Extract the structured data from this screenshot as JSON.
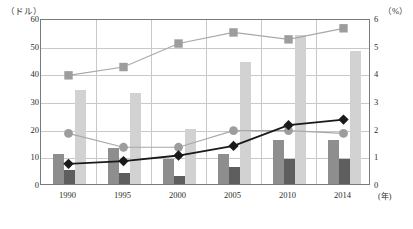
{
  "axes": {
    "left_unit": "（ドル）",
    "right_unit": "（%）",
    "x_unit": "(年)",
    "left_ticks": [
      "0",
      "10",
      "20",
      "30",
      "40",
      "50",
      "60"
    ],
    "right_ticks": [
      "0",
      "1",
      "2",
      "3",
      "4",
      "5",
      "6"
    ]
  },
  "chart_data": {
    "type": "bar",
    "title": "",
    "subtitle": "",
    "xlabel": "(年)",
    "ylabel": "（ドル）",
    "y2label": "（%）",
    "ylim": [
      0,
      60
    ],
    "y2lim": [
      0,
      6
    ],
    "grid": true,
    "legend": "none",
    "categories": [
      "1990",
      "1995",
      "2000",
      "2005",
      "2010",
      "2014"
    ],
    "series": [
      {
        "name": "bar-series-1",
        "type": "bar",
        "axis": "left",
        "color": "#8e8e8e",
        "values": [
          11,
          13,
          9,
          11,
          16,
          16
        ]
      },
      {
        "name": "bar-series-2",
        "type": "bar",
        "axis": "left",
        "color": "#5e5e5e",
        "values": [
          5,
          4,
          3,
          6,
          9,
          9
        ]
      },
      {
        "name": "bar-series-3",
        "type": "bar",
        "axis": "left",
        "color": "#d2d2d2",
        "values": [
          34,
          33,
          20,
          44,
          54,
          48
        ]
      },
      {
        "name": "line-square-series",
        "type": "line",
        "axis": "right",
        "color": "#a8a8a8",
        "marker": "square",
        "values": [
          4.0,
          4.3,
          5.15,
          5.55,
          5.3,
          5.7
        ]
      },
      {
        "name": "line-circle-series",
        "type": "line",
        "axis": "right",
        "color": "#a8a8a8",
        "marker": "circle",
        "values": [
          1.9,
          1.4,
          1.4,
          2.0,
          2.0,
          1.9
        ]
      },
      {
        "name": "line-diamond-series",
        "type": "line",
        "axis": "right",
        "color": "#1a1a1a",
        "marker": "diamond",
        "values": [
          0.8,
          0.9,
          1.1,
          1.45,
          2.2,
          2.4
        ]
      }
    ]
  }
}
